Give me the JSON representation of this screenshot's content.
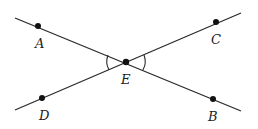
{
  "diagram": {
    "type": "intersecting-lines",
    "intersection": "E",
    "points": [
      {
        "id": "A",
        "label": "A",
        "x": 38,
        "y": 26,
        "lx": 35,
        "ly": 48
      },
      {
        "id": "C",
        "label": "C",
        "x": 216,
        "y": 22,
        "lx": 211,
        "ly": 44
      },
      {
        "id": "D",
        "label": "D",
        "x": 42,
        "y": 98,
        "lx": 39,
        "ly": 120
      },
      {
        "id": "B",
        "label": "B",
        "x": 213,
        "y": 99,
        "lx": 208,
        "ly": 121
      },
      {
        "id": "E",
        "label": "E",
        "x": 126,
        "y": 62,
        "lx": 121,
        "ly": 84
      }
    ],
    "lines": [
      {
        "name": "line-AB",
        "x1": 15,
        "y1": 18,
        "x2": 241,
        "y2": 111
      },
      {
        "name": "line-DC",
        "x1": 15,
        "y1": 110,
        "x2": 241,
        "y2": 13
      }
    ],
    "angle_marks": [
      "angle-AED",
      "angle-CEB"
    ],
    "colors": {
      "line": "#2a2a2a",
      "point": "#111111"
    }
  }
}
